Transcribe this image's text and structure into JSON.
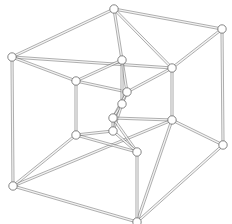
{
  "figure": {
    "kind": "diagram",
    "background_color": "#ffffff",
    "edge_color": "#6a6a6a",
    "edge_fill_color": "#f4f4f4",
    "vertex_fill_color": "#ffffff",
    "vertex_stroke_color": "#5d5d5d",
    "vertex_radius": 4.2,
    "edge_tube_width": 2.1,
    "width": 232,
    "height": 224
  },
  "graph": {
    "vertex_count": 16,
    "edge_count": 32,
    "vertices": [
      {
        "id": "O0",
        "label": "outer-top",
        "x": 114,
        "y": 9
      },
      {
        "id": "O1",
        "label": "outer-top-right",
        "x": 222,
        "y": 29
      },
      {
        "id": "O2",
        "label": "outer-left",
        "x": 12,
        "y": 57
      },
      {
        "id": "O3",
        "label": "outer-mid-right",
        "x": 172,
        "y": 68
      },
      {
        "id": "O4",
        "label": "outer-bottom-left",
        "x": 13,
        "y": 186
      },
      {
        "id": "O5",
        "label": "outer-right-lower",
        "x": 223,
        "y": 145
      },
      {
        "id": "O6",
        "label": "outer-lower-right",
        "x": 172,
        "y": 120
      },
      {
        "id": "O7",
        "label": "outer-bottom",
        "x": 137,
        "y": 222
      },
      {
        "id": "I0",
        "label": "inner-top-left",
        "x": 76,
        "y": 81
      },
      {
        "id": "I1",
        "label": "inner-top-center",
        "x": 122,
        "y": 60
      },
      {
        "id": "I2",
        "label": "inner-core-upper",
        "x": 127,
        "y": 92
      },
      {
        "id": "I3",
        "label": "inner-core-mid",
        "x": 122,
        "y": 104
      },
      {
        "id": "I4",
        "label": "inner-lower-left",
        "x": 76,
        "y": 135
      },
      {
        "id": "I5",
        "label": "inner-core-low",
        "x": 113,
        "y": 118
      },
      {
        "id": "I6",
        "label": "inner-core-bottom",
        "x": 113,
        "y": 131
      },
      {
        "id": "I7",
        "label": "inner-bottom-center",
        "x": 137,
        "y": 152
      }
    ],
    "edges": [
      [
        "O0",
        "O1"
      ],
      [
        "O0",
        "O2"
      ],
      [
        "O0",
        "O3"
      ],
      [
        "O1",
        "O3"
      ],
      [
        "O1",
        "O5"
      ],
      [
        "O2",
        "O3"
      ],
      [
        "O2",
        "O4"
      ],
      [
        "O3",
        "O6"
      ],
      [
        "O4",
        "O6"
      ],
      [
        "O4",
        "O7"
      ],
      [
        "O5",
        "O6"
      ],
      [
        "O5",
        "O7"
      ],
      [
        "O6",
        "O7"
      ],
      [
        "I0",
        "I1"
      ],
      [
        "I0",
        "I2"
      ],
      [
        "I0",
        "I4"
      ],
      [
        "I1",
        "I2"
      ],
      [
        "I1",
        "I3"
      ],
      [
        "I2",
        "I3"
      ],
      [
        "I2",
        "I5"
      ],
      [
        "I3",
        "I5"
      ],
      [
        "I3",
        "I6"
      ],
      [
        "I4",
        "I6"
      ],
      [
        "I4",
        "I7"
      ],
      [
        "I5",
        "I6"
      ],
      [
        "I5",
        "I7"
      ],
      [
        "I6",
        "I7"
      ],
      [
        "O0",
        "I1"
      ],
      [
        "O2",
        "I0"
      ],
      [
        "O3",
        "I2"
      ],
      [
        "O4",
        "I4"
      ],
      [
        "O6",
        "I5"
      ],
      [
        "O7",
        "I7"
      ]
    ]
  }
}
